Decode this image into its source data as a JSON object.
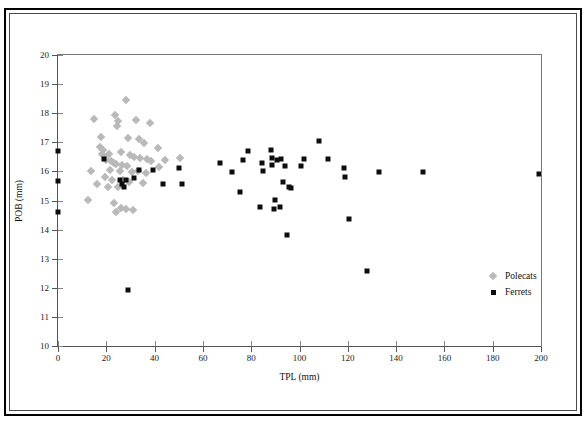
{
  "chart_data": {
    "type": "scatter",
    "title": "",
    "xlabel": "TPL (mm)",
    "ylabel": "POB (mm)",
    "xlim": [
      0,
      200
    ],
    "ylim": [
      10,
      20
    ],
    "xticks": [
      0,
      20,
      40,
      60,
      80,
      100,
      120,
      140,
      160,
      180,
      200
    ],
    "yticks": [
      10,
      11,
      12,
      13,
      14,
      15,
      16,
      17,
      18,
      19,
      20
    ],
    "grid": false,
    "legend_position": "inside-lower-right",
    "series": [
      {
        "name": "Polecats",
        "marker": "diamond",
        "color": "#b9b9b9",
        "points": [
          [
            28.0,
            18.45
          ],
          [
            23.5,
            17.95
          ],
          [
            15.0,
            17.8
          ],
          [
            25.0,
            17.72
          ],
          [
            32.5,
            17.75
          ],
          [
            24.5,
            17.55
          ],
          [
            38.0,
            17.65
          ],
          [
            18.0,
            17.18
          ],
          [
            29.0,
            17.15
          ],
          [
            33.5,
            17.1
          ],
          [
            35.5,
            16.98
          ],
          [
            17.5,
            16.85
          ],
          [
            18.5,
            16.75
          ],
          [
            18.2,
            16.6
          ],
          [
            19.0,
            16.52
          ],
          [
            21.0,
            16.6
          ],
          [
            41.5,
            16.8
          ],
          [
            26.0,
            16.68
          ],
          [
            30.0,
            16.55
          ],
          [
            31.5,
            16.48
          ],
          [
            34.0,
            16.45
          ],
          [
            37.0,
            16.42
          ],
          [
            38.5,
            16.35
          ],
          [
            44.5,
            16.4
          ],
          [
            50.5,
            16.45
          ],
          [
            20.0,
            16.38
          ],
          [
            22.0,
            16.35
          ],
          [
            23.0,
            16.3
          ],
          [
            24.0,
            16.25
          ],
          [
            26.5,
            16.22
          ],
          [
            28.5,
            16.18
          ],
          [
            42.0,
            16.15
          ],
          [
            13.5,
            16.02
          ],
          [
            21.5,
            16.05
          ],
          [
            25.5,
            16.0
          ],
          [
            30.5,
            15.98
          ],
          [
            33.0,
            16.02
          ],
          [
            36.5,
            15.95
          ],
          [
            19.5,
            15.8
          ],
          [
            22.5,
            15.72
          ],
          [
            27.0,
            15.7
          ],
          [
            29.5,
            15.62
          ],
          [
            35.0,
            15.6
          ],
          [
            16.0,
            15.58
          ],
          [
            20.5,
            15.48
          ],
          [
            25.0,
            15.45
          ],
          [
            12.5,
            15.02
          ],
          [
            23.0,
            14.92
          ],
          [
            26.0,
            14.75
          ],
          [
            28.0,
            14.72
          ],
          [
            31.0,
            14.68
          ],
          [
            24.0,
            14.62
          ]
        ]
      },
      {
        "name": "Ferrets",
        "marker": "square",
        "color": "#0d0d0d",
        "points": [
          [
            0.0,
            16.7
          ],
          [
            0.0,
            15.68
          ],
          [
            0.0,
            14.62
          ],
          [
            19.0,
            16.42
          ],
          [
            25.5,
            15.72
          ],
          [
            28.0,
            15.72
          ],
          [
            26.5,
            15.55
          ],
          [
            27.5,
            15.48
          ],
          [
            31.5,
            15.78
          ],
          [
            33.5,
            16.05
          ],
          [
            39.5,
            16.05
          ],
          [
            43.5,
            15.55
          ],
          [
            50.0,
            16.12
          ],
          [
            51.5,
            15.58
          ],
          [
            29.0,
            11.92
          ],
          [
            67.0,
            16.28
          ],
          [
            72.0,
            15.98
          ],
          [
            76.5,
            16.4
          ],
          [
            78.5,
            16.7
          ],
          [
            75.5,
            15.28
          ],
          [
            84.5,
            16.28
          ],
          [
            85.0,
            16.02
          ],
          [
            88.0,
            16.72
          ],
          [
            88.5,
            16.45
          ],
          [
            88.5,
            16.22
          ],
          [
            83.5,
            14.78
          ],
          [
            89.5,
            14.72
          ],
          [
            90.5,
            16.38
          ],
          [
            92.5,
            16.42
          ],
          [
            94.0,
            16.2
          ],
          [
            93.0,
            15.65
          ],
          [
            95.5,
            15.48
          ],
          [
            96.5,
            15.42
          ],
          [
            90.0,
            15.02
          ],
          [
            92.0,
            14.78
          ],
          [
            95.0,
            13.82
          ],
          [
            100.5,
            16.2
          ],
          [
            102.0,
            16.42
          ],
          [
            108.0,
            17.05
          ],
          [
            112.0,
            16.42
          ],
          [
            118.5,
            16.12
          ],
          [
            119.0,
            15.82
          ],
          [
            120.5,
            14.35
          ],
          [
            128.0,
            12.58
          ],
          [
            133.0,
            15.98
          ],
          [
            151.0,
            15.98
          ],
          [
            199.0,
            15.92
          ]
        ]
      }
    ]
  },
  "axis": {
    "x_title": "TPL (mm)",
    "y_title": "POB (mm)"
  },
  "legend": {
    "items": [
      {
        "label": "Polecats",
        "marker": "diamond-icon",
        "color": "#b9b9b9"
      },
      {
        "label": "Ferrets",
        "marker": "square-icon",
        "color": "#0d0d0d"
      }
    ]
  }
}
